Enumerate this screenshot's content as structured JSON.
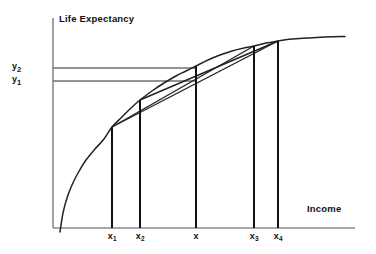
{
  "chart_data": {
    "type": "line",
    "title": "",
    "subtitle": "",
    "xlabel": "Income",
    "ylabel": "Life Expectancy",
    "grid": false,
    "legend": null,
    "axes": {
      "x_origin_px": 53,
      "y_origin_px": 228,
      "x_axis_end_px": 355,
      "y_axis_top_px": 18,
      "xlim_label": "Income",
      "ylim_label": "Life Expectancy",
      "ticks_numeric": false
    },
    "x_tick_labels": [
      "x",
      "x",
      "x",
      "x",
      "x"
    ],
    "x_tick_subscripts": [
      "1",
      "2",
      "",
      "3",
      "4"
    ],
    "x_tick_text": [
      "x1",
      "x2",
      "x",
      "x3",
      "x4"
    ],
    "y_tick_labels": [
      "y",
      "y"
    ],
    "y_tick_subscripts": [
      "2",
      "1"
    ],
    "y_tick_text": [
      "y2",
      "y1"
    ],
    "curve": {
      "name": "life-expectancy-income-curve",
      "shape": "concave increasing, diminishing returns",
      "points": [
        [
          60,
          232
        ],
        [
          63,
          213
        ],
        [
          67,
          198
        ],
        [
          72,
          185
        ],
        [
          78,
          173
        ],
        [
          86,
          160
        ],
        [
          95,
          149
        ],
        [
          104,
          139
        ],
        [
          112,
          127
        ],
        [
          122,
          117
        ],
        [
          131,
          108
        ],
        [
          140,
          100
        ],
        [
          152,
          91
        ],
        [
          164,
          83
        ],
        [
          176,
          76
        ],
        [
          186,
          71
        ],
        [
          196,
          66
        ],
        [
          208,
          60
        ],
        [
          220,
          55
        ],
        [
          232,
          51
        ],
        [
          244,
          48
        ],
        [
          254,
          46
        ],
        [
          266,
          43
        ],
        [
          278,
          41
        ],
        [
          292,
          39
        ],
        [
          308,
          38
        ],
        [
          326,
          37
        ],
        [
          345,
          36.5
        ]
      ]
    },
    "drop_lines": [
      {
        "name": "drop-line-x1",
        "x": 112,
        "y_top": 127,
        "y_bottom": 228
      },
      {
        "name": "drop-line-x2",
        "x": 140,
        "y_top": 100,
        "y_bottom": 228
      },
      {
        "name": "drop-line-x",
        "x": 196,
        "y_top": 66,
        "y_bottom": 228
      },
      {
        "name": "drop-line-x3",
        "x": 254,
        "y_top": 46,
        "y_bottom": 228
      },
      {
        "name": "drop-line-x4",
        "x": 278,
        "y_top": 41,
        "y_bottom": 228
      }
    ],
    "x_tick_positions": [
      112,
      140,
      196,
      254,
      278
    ],
    "horizontal_lines": [
      {
        "name": "level-line-y2",
        "y": 68,
        "x_start": 53,
        "x_end": 196,
        "label": "y2"
      },
      {
        "name": "level-line-y1",
        "y": 81,
        "x_start": 53,
        "x_end": 196,
        "label": "y1"
      }
    ],
    "y_tick_positions": [
      68,
      81
    ],
    "chords": [
      {
        "name": "chord-x1-x3",
        "from": [
          112,
          127
        ],
        "to": [
          254,
          46
        ]
      },
      {
        "name": "chord-x1-x4",
        "from": [
          112,
          127
        ],
        "to": [
          278,
          41
        ]
      },
      {
        "name": "chord-x2-x4",
        "from": [
          140,
          100
        ],
        "to": [
          278,
          41
        ]
      }
    ],
    "annotations": [
      "Concave utility-style curve of life expectancy against income",
      "Chords drawn between points on the curve illustrate averaging",
      "Horizontal reference levels y1 and y2 meet the vertical at x"
    ],
    "colors": {
      "ink": "#111111",
      "axis": "#8a8a8a",
      "curve": "#222222",
      "chord": "#222222",
      "drop": "#111111",
      "level": "#6f6f6f",
      "background": "#ffffff"
    }
  },
  "labels": {
    "y_axis_title": "Life Expectancy",
    "x_axis_title": "Income",
    "x1_main": "x",
    "x1_sub": "1",
    "x2_main": "x",
    "x2_sub": "2",
    "x3_main": "x",
    "x3_sub": "3",
    "x4_main": "x",
    "x4_sub": "4",
    "x_main": "x",
    "x_sub": "",
    "y1_main": "y",
    "y1_sub": "1",
    "y2_main": "y",
    "y2_sub": "2"
  }
}
